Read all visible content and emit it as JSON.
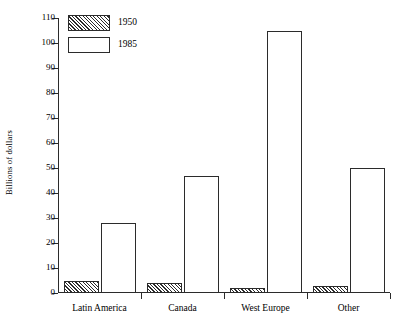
{
  "chart_data": {
    "type": "bar",
    "title": "",
    "xlabel": "",
    "ylabel": "Billions of dollars",
    "categories": [
      "Latin America",
      "Canada",
      "West Europe",
      "Other"
    ],
    "series": [
      {
        "name": "1950",
        "values": [
          5,
          4,
          2,
          3
        ]
      },
      {
        "name": "1985",
        "values": [
          28,
          47,
          105,
          50
        ]
      }
    ],
    "ylim": [
      0,
      110
    ],
    "ytick_step": 10,
    "yticks": [
      0,
      10,
      20,
      30,
      40,
      50,
      60,
      70,
      80,
      90,
      100,
      110
    ],
    "ytick_labels": [
      "0",
      "10",
      "20",
      "30",
      "40",
      "50",
      "60",
      "70",
      "80",
      "90",
      "100",
      "110"
    ],
    "grid": false,
    "legend_position": "top-left",
    "legend": [
      "1950",
      "1985"
    ],
    "colors": {
      "axis": "#2b2b2b",
      "bar_outline": "#2b2b2b",
      "bar_fill_1985": "#ffffff",
      "bar_fill_1950": "#ffffff",
      "hatch": "#2b2b2b",
      "background": "#ffffff"
    }
  }
}
